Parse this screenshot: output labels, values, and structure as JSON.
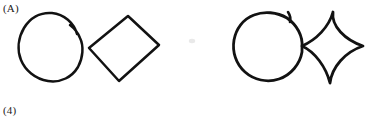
{
  "page": {
    "background_color": "#ffffff",
    "ink_color": "#121212",
    "width": 366,
    "height": 134
  },
  "labels": {
    "top_left": "(A)",
    "bottom_left": "(4)"
  },
  "figure": {
    "items": [
      {
        "group": "left-pair",
        "shapes": [
          {
            "name": "circle",
            "style": "hand-drawn closed rounded blob with slight pen overshoot at top",
            "center_x": 52,
            "center_y": 47,
            "radius_x": 34,
            "radius_y": 35,
            "touches_neighbor": false
          },
          {
            "name": "diamond",
            "style": "straight-sided rotated square",
            "vertices": [
              [
                128,
                16
              ],
              [
                159,
                45
              ],
              [
                119,
                81
              ],
              [
                89,
                48
              ]
            ],
            "side_curvature": 0
          }
        ]
      },
      {
        "group": "right-pair",
        "shapes": [
          {
            "name": "circle",
            "style": "hand-drawn circle with pen hook overshoot at top right",
            "center_x": 272,
            "center_y": 46,
            "radius_x": 33,
            "radius_y": 34,
            "touches_neighbor": true
          },
          {
            "name": "diamond",
            "style": "concave curved-sided diamond (astroid / four-pointed star)",
            "vertices": [
              [
                333,
                12
              ],
              [
                363,
                46
              ],
              [
                330,
                83
              ],
              [
                302,
                46
              ]
            ],
            "side_curvature": -0.3
          }
        ]
      }
    ]
  }
}
